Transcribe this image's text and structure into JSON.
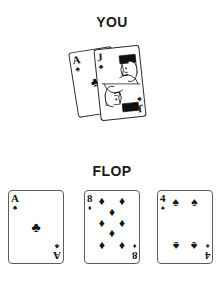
{
  "background_color": "#ffffff",
  "ink_color": "#111111",
  "labels": {
    "you": "YOU",
    "flop": "FLOP"
  },
  "hole_cards": {
    "label": "YOU",
    "cards": [
      {
        "rank": "A",
        "suit": "clubs",
        "suit_glyph": "♣",
        "name": "ace-of-clubs",
        "face_card": false
      },
      {
        "rank": "J",
        "suit": "clubs",
        "suit_glyph": "♣",
        "name": "jack-of-clubs",
        "face_card": true
      }
    ]
  },
  "flop_cards": {
    "label": "FLOP",
    "cards": [
      {
        "rank": "A",
        "suit": "clubs",
        "suit_glyph": "♣",
        "name": "ace-of-clubs",
        "pip_count": 1
      },
      {
        "rank": "8",
        "suit": "diamonds",
        "suit_glyph": "♦",
        "name": "eight-of-diamonds",
        "pip_count": 8
      },
      {
        "rank": "4",
        "suit": "spades",
        "suit_glyph": "♠",
        "name": "four-of-spades",
        "pip_count": 4
      }
    ]
  }
}
